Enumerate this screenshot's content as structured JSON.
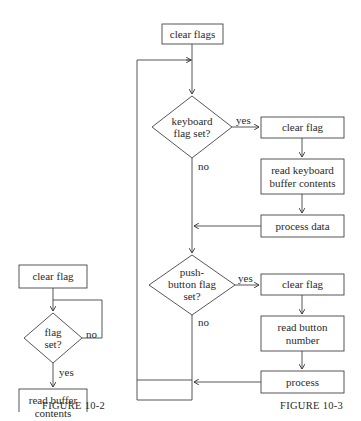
{
  "figure_10_2": {
    "caption": "FIGURE 10-2",
    "nodes": {
      "clear_flag": "clear flag",
      "decision_line1": "flag",
      "decision_line2": "set?",
      "read_line1": "read buffer",
      "read_line2": "contents"
    },
    "edges": {
      "yes": "yes",
      "no": "no"
    }
  },
  "figure_10_3": {
    "caption": "FIGURE 10-3",
    "nodes": {
      "clear_flags": "clear flags",
      "kb_decision_line1": "keyboard",
      "kb_decision_line2": "flag set?",
      "kb_clear_flag": "clear flag",
      "kb_read_line1": "read keyboard",
      "kb_read_line2": "buffer contents",
      "process_data": "process data",
      "pb_decision_line1": "push-",
      "pb_decision_line2": "button flag",
      "pb_decision_line3": "set?",
      "pb_clear_flag": "clear flag",
      "pb_read_line1": "read button",
      "pb_read_line2": "number",
      "process": "process"
    },
    "edges": {
      "kb_yes": "yes",
      "kb_no": "no",
      "pb_yes": "yes",
      "pb_no": "no"
    }
  }
}
